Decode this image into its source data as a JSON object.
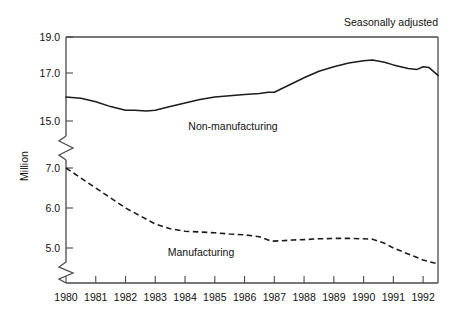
{
  "chart_data": {
    "type": "line",
    "title": "",
    "annotation": "Seasonally adjusted",
    "xlabel": "",
    "ylabel": "Million",
    "grid": false,
    "legend_position": "inline-labels",
    "axis_breaks": [
      {
        "between": [
          15.0,
          7.0
        ],
        "note": "scale break between upper and lower panel"
      },
      {
        "below": 5.0,
        "note": "scale break beneath lowest tick"
      }
    ],
    "upper_axis": {
      "ticks": [
        "19.0",
        "17.0",
        "15.0"
      ],
      "tick_values": [
        19.0,
        17.0,
        15.0
      ],
      "range": [
        15.0,
        19.0
      ]
    },
    "lower_axis": {
      "ticks": [
        "7.0",
        "6.0",
        "5.0"
      ],
      "tick_values": [
        7.0,
        6.0,
        5.0
      ],
      "range": [
        4.4,
        7.0
      ]
    },
    "xticks": [
      "1980",
      "1981",
      "1982",
      "1983",
      "1984",
      "1985",
      "1986",
      "1987",
      "1988",
      "1989",
      "1990",
      "1991",
      "1992"
    ],
    "x": [
      1980,
      1981,
      1982,
      1983,
      1984,
      1985,
      1986,
      1987,
      1988,
      1989,
      1990,
      1991,
      1992
    ],
    "xlim": [
      1980,
      1992.5
    ],
    "series": [
      {
        "name": "Non-manufacturing",
        "label": "Non-manufacturing",
        "style": "solid",
        "color": "#1c1c1c",
        "panel": "upper",
        "x": [
          1980.0,
          1980.5,
          1981.0,
          1981.5,
          1982.0,
          1982.3,
          1982.7,
          1983.0,
          1983.5,
          1984.0,
          1984.5,
          1985.0,
          1985.5,
          1986.0,
          1986.5,
          1986.8,
          1987.0,
          1987.5,
          1988.0,
          1988.5,
          1989.0,
          1989.5,
          1990.0,
          1990.3,
          1990.7,
          1991.0,
          1991.5,
          1991.8,
          1992.0,
          1992.2,
          1992.5
        ],
        "values": [
          16.0,
          15.95,
          15.8,
          15.6,
          15.45,
          15.45,
          15.42,
          15.45,
          15.6,
          15.75,
          15.9,
          16.0,
          16.05,
          16.1,
          16.15,
          16.2,
          16.2,
          16.5,
          16.8,
          17.1,
          17.35,
          17.55,
          17.68,
          17.72,
          17.6,
          17.45,
          17.25,
          17.2,
          17.35,
          17.3,
          16.9
        ]
      },
      {
        "name": "Manufacturing",
        "label": "Manufacturing",
        "style": "dashed",
        "color": "#1c1c1c",
        "panel": "lower",
        "x": [
          1980.0,
          1980.5,
          1981.0,
          1981.5,
          1982.0,
          1982.5,
          1983.0,
          1983.5,
          1984.0,
          1984.5,
          1985.0,
          1985.5,
          1986.0,
          1986.5,
          1986.9,
          1987.2,
          1987.6,
          1988.0,
          1988.5,
          1989.0,
          1989.5,
          1990.0,
          1990.3,
          1990.7,
          1991.0,
          1991.5,
          1992.0,
          1992.5
        ],
        "values": [
          7.0,
          6.75,
          6.5,
          6.25,
          6.0,
          5.8,
          5.6,
          5.48,
          5.42,
          5.4,
          5.38,
          5.35,
          5.33,
          5.28,
          5.17,
          5.18,
          5.2,
          5.21,
          5.23,
          5.24,
          5.24,
          5.23,
          5.22,
          5.12,
          5.0,
          4.85,
          4.7,
          4.6
        ]
      }
    ]
  }
}
